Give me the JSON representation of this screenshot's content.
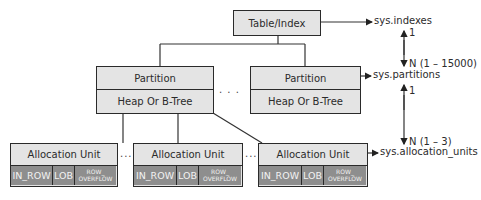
{
  "diagram": {
    "root": {
      "label": "Table/Index",
      "catalog_view": "sys.indexes"
    },
    "partitions": [
      {
        "label": "Partition",
        "structure": "Heap Or B-Tree"
      },
      {
        "label": "Partition",
        "structure": "Heap Or B-Tree"
      }
    ],
    "partitions_ellipsis": ". . .",
    "partitions_catalog_view": "sys.partitions",
    "allocation_units": [
      {
        "label": "Allocation Unit",
        "types": [
          "IN_ROW",
          "LOB",
          "ROW_\nOVERFLOW"
        ]
      },
      {
        "label": "Allocation Unit",
        "types": [
          "IN_ROW",
          "LOB",
          "ROW_\nOVERFLOW"
        ]
      },
      {
        "label": "Allocation Unit",
        "types": [
          "IN_ROW",
          "LOB",
          "ROW_\nOVERFLOW"
        ]
      }
    ],
    "allocation_ellipsis": "...",
    "allocation_catalog_view": "sys.allocation_units",
    "cardinality": {
      "indexes_to_partitions": {
        "one": "1",
        "many": "N (1 – 15000)"
      },
      "partitions_to_allocation_units": {
        "one": "1",
        "many": "N (1 – 3)"
      }
    },
    "colors": {
      "light_fill": "#e4e4e4",
      "dark_fill": "#8e8e8e",
      "border": "#2a2a2a"
    }
  }
}
